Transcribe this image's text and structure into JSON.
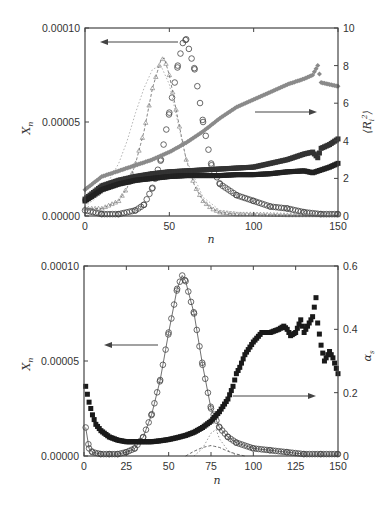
{
  "chart_data": [
    {
      "id": "top",
      "type": "scatter",
      "title": "",
      "xlabel": "n",
      "ylabel_left": "X_n",
      "ylabel_right": "⟨R_i^2⟩",
      "xlim": [
        0,
        150
      ],
      "ylim_left": [
        0,
        0.0001
      ],
      "ylim_right": [
        0,
        10
      ],
      "x_ticks": [
        "0",
        "50",
        "100",
        "150"
      ],
      "y_left_ticks": [
        "0.00000",
        "0.00005",
        "0.00010"
      ],
      "y_right_ticks": [
        "0",
        "2",
        "4",
        "6",
        "8",
        "10"
      ],
      "grid": false,
      "annotations": [
        {
          "type": "arrow",
          "direction": "left",
          "meaning": "circle/triangle distributions use left axis X_n"
        },
        {
          "type": "arrow",
          "direction": "right",
          "meaning": "filled series use right axis <R_i^2>"
        }
      ],
      "series": [
        {
          "name": "X_n distribution A (circles)",
          "axis": "left",
          "marker": "open-circle",
          "color": "#444444",
          "x": [
            0,
            10,
            20,
            30,
            35,
            40,
            45,
            50,
            55,
            58,
            60,
            65,
            70,
            75,
            80,
            90,
            100,
            110,
            120,
            130,
            140,
            150
          ],
          "y": [
            3e-06,
            1e-06,
            1e-06,
            3e-06,
            6e-06,
            1.5e-05,
            3e-05,
            5.5e-05,
            8e-05,
            9.2e-05,
            9.4e-05,
            7.8e-05,
            5e-05,
            2.7e-05,
            1.7e-05,
            1.1e-05,
            8e-06,
            5e-06,
            4e-06,
            2e-06,
            1e-06,
            1e-06
          ]
        },
        {
          "name": "X_n distribution B (triangles, dashed)",
          "axis": "left",
          "marker": "open-triangle",
          "color": "#777777",
          "x": [
            0,
            10,
            20,
            25,
            30,
            35,
            40,
            45,
            47,
            50,
            55,
            60,
            65,
            70,
            75,
            80,
            90,
            100,
            120,
            150
          ],
          "y": [
            4e-06,
            4e-06,
            8e-06,
            1.5e-05,
            2.8e-05,
            4.5e-05,
            6.8e-05,
            8.3e-05,
            8.4e-05,
            7.5e-05,
            5.2e-05,
            3e-05,
            1.6e-05,
            8e-06,
            4e-06,
            2e-06,
            1e-06,
            1e-06,
            5e-07,
            5e-07
          ]
        },
        {
          "name": "X_n distribution C (dotted, light)",
          "axis": "left",
          "marker": "dot",
          "color": "#aaaaaa",
          "x": [
            0,
            10,
            20,
            25,
            30,
            35,
            40,
            45,
            50,
            55,
            60,
            70,
            80,
            100,
            150
          ],
          "y": [
            5e-06,
            1.2e-05,
            2.8e-05,
            4e-05,
            5.5e-05,
            6.8e-05,
            7.8e-05,
            8e-05,
            7e-05,
            5e-05,
            3e-05,
            1e-05,
            3e-06,
            1e-06,
            5e-07
          ]
        },
        {
          "name": "<R_i^2> series 1 (gray diamonds)",
          "axis": "right",
          "marker": "filled-diamond",
          "color": "#8a8a8a",
          "x": [
            0,
            10,
            20,
            30,
            40,
            50,
            60,
            70,
            80,
            90,
            100,
            110,
            120,
            130,
            135,
            138,
            140,
            145,
            150
          ],
          "y": [
            1.4,
            2.1,
            2.4,
            2.7,
            3.0,
            3.4,
            3.9,
            4.5,
            5.2,
            5.8,
            6.2,
            6.6,
            7.0,
            7.3,
            7.5,
            8.0,
            7.1,
            7.0,
            6.9
          ]
        },
        {
          "name": "<R_i^2> series 2 (dark squares, upper)",
          "axis": "right",
          "marker": "filled-square",
          "color": "#333333",
          "x": [
            0,
            10,
            20,
            30,
            40,
            50,
            60,
            70,
            80,
            90,
            100,
            110,
            120,
            130,
            135,
            138,
            140,
            145,
            150
          ],
          "y": [
            0.9,
            1.6,
            1.9,
            2.1,
            2.25,
            2.35,
            2.4,
            2.45,
            2.5,
            2.55,
            2.6,
            2.8,
            3.0,
            3.3,
            3.4,
            3.1,
            3.6,
            3.8,
            4.1
          ]
        },
        {
          "name": "<R_i^2> series 3 (dark squares, lower)",
          "axis": "right",
          "marker": "filled-square",
          "color": "#222222",
          "x": [
            0,
            10,
            20,
            30,
            40,
            50,
            60,
            70,
            80,
            90,
            100,
            110,
            120,
            130,
            135,
            140,
            145,
            150
          ],
          "y": [
            0.8,
            1.4,
            1.7,
            1.9,
            2.0,
            2.1,
            2.15,
            2.15,
            2.15,
            2.2,
            2.2,
            2.25,
            2.35,
            2.4,
            2.3,
            2.45,
            2.6,
            2.8
          ]
        }
      ]
    },
    {
      "id": "bottom",
      "type": "scatter",
      "title": "",
      "xlabel": "n",
      "ylabel_left": "X_n",
      "ylabel_right": "α_s",
      "xlim": [
        0,
        150
      ],
      "ylim_left": [
        0,
        0.0001
      ],
      "ylim_right": [
        0,
        0.6
      ],
      "x_ticks": [
        "0",
        "25",
        "50",
        "75",
        "100",
        "125",
        "150"
      ],
      "y_left_ticks": [
        "0.00000",
        "0.00005",
        "0.00010"
      ],
      "y_right_ticks": [
        "0",
        "0.2",
        "0.4",
        "0.6"
      ],
      "grid": false,
      "annotations": [
        {
          "type": "arrow",
          "direction": "left",
          "meaning": "circles use left axis X_n"
        },
        {
          "type": "arrow",
          "direction": "right",
          "meaning": "filled squares use right axis α_s"
        }
      ],
      "series": [
        {
          "name": "X_n (open circles with fit line)",
          "axis": "left",
          "marker": "open-circle",
          "color": "#444444",
          "x": [
            1,
            3,
            5,
            10,
            15,
            20,
            25,
            30,
            35,
            40,
            45,
            50,
            55,
            58,
            60,
            65,
            70,
            75,
            80,
            85,
            90,
            100,
            110,
            120,
            130,
            140,
            150
          ],
          "y": [
            1.5e-05,
            4e-06,
            2e-06,
            1e-06,
            1e-06,
            1e-06,
            2e-06,
            4e-06,
            1e-05,
            2.2e-05,
            4e-05,
            6.5e-05,
            8.8e-05,
            9.5e-05,
            9.2e-05,
            7.5e-05,
            4.8e-05,
            2.5e-05,
            1.5e-05,
            1e-05,
            7e-06,
            4e-06,
            3e-06,
            2e-06,
            1e-06,
            1e-06,
            1e-06
          ]
        },
        {
          "name": "fit component (dashed)",
          "axis": "left",
          "marker": "none",
          "line": "dashed",
          "color": "#555555",
          "x": [
            60,
            65,
            70,
            75,
            80,
            85,
            90,
            95
          ],
          "y": [
            0.0,
            2.5e-06,
            4.5e-06,
            5.5e-06,
            4.5e-06,
            2.5e-06,
            1e-06,
            0.0
          ]
        },
        {
          "name": "fit component (dotted)",
          "axis": "left",
          "marker": "none",
          "line": "dotted",
          "color": "#888888",
          "x": [
            65,
            70,
            75,
            78,
            80,
            85,
            90
          ],
          "y": [
            0.0,
            4e-06,
            1.2e-05,
            1.4e-05,
            9e-06,
            3e-06,
            0.0
          ]
        },
        {
          "name": "α_s (filled squares)",
          "axis": "right",
          "marker": "filled-square",
          "color": "#1a1a1a",
          "x": [
            1,
            3,
            5,
            7,
            10,
            15,
            20,
            25,
            30,
            35,
            40,
            45,
            50,
            55,
            60,
            65,
            70,
            75,
            80,
            85,
            88,
            90,
            92,
            95,
            100,
            105,
            110,
            115,
            118,
            120,
            122,
            125,
            128,
            130,
            133,
            135,
            137,
            138,
            140,
            142,
            145,
            147,
            150
          ],
          "y": [
            0.22,
            0.17,
            0.13,
            0.1,
            0.08,
            0.06,
            0.05,
            0.045,
            0.045,
            0.045,
            0.045,
            0.048,
            0.052,
            0.058,
            0.065,
            0.075,
            0.09,
            0.11,
            0.14,
            0.18,
            0.22,
            0.26,
            0.28,
            0.32,
            0.36,
            0.39,
            0.39,
            0.4,
            0.41,
            0.4,
            0.38,
            0.39,
            0.43,
            0.39,
            0.42,
            0.44,
            0.5,
            0.42,
            0.35,
            0.3,
            0.33,
            0.31,
            0.26
          ]
        }
      ]
    }
  ],
  "labels": {
    "top_xlabel": "n",
    "bottom_xlabel": "n",
    "top_ylabel_left": "X",
    "top_ylabel_left_sub": "n",
    "bottom_ylabel_left": "X",
    "bottom_ylabel_left_sub": "n",
    "top_ylabel_right": "⟨R",
    "top_ylabel_right_sub": "i",
    "top_ylabel_right_sup": "2",
    "top_ylabel_right_close": "⟩",
    "bottom_ylabel_right": "α",
    "bottom_ylabel_right_sub": "s"
  }
}
